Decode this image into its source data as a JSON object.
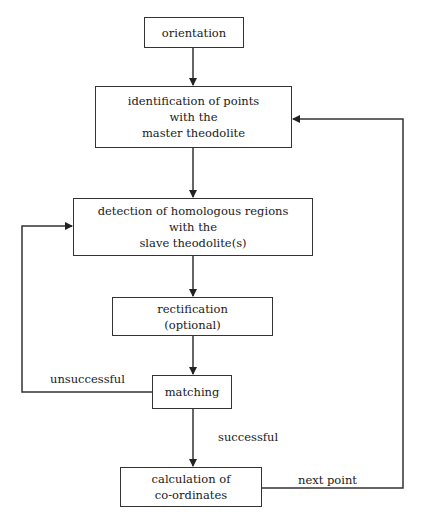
{
  "diagram": {
    "nodes": {
      "orientation": {
        "lines": [
          "orientation"
        ]
      },
      "identification": {
        "lines": [
          "identification of points",
          "with the",
          "master theodolite"
        ]
      },
      "detection": {
        "lines": [
          "detection of homologous regions",
          "with the",
          "slave theodolite(s)"
        ]
      },
      "rectification": {
        "lines": [
          "rectification",
          "(optional)"
        ]
      },
      "matching": {
        "lines": [
          "matching"
        ]
      },
      "calculation": {
        "lines": [
          "calculation of",
          "co-ordinates"
        ]
      }
    },
    "edge_labels": {
      "unsuccessful": "unsuccessful",
      "successful": "successful",
      "next_point": "next point"
    },
    "colors": {
      "line": "#333333",
      "text": "#1a1a1a",
      "background": "#ffffff"
    }
  }
}
